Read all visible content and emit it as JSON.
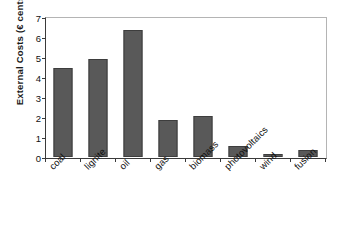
{
  "chart_data": {
    "type": "bar",
    "title": "",
    "xlabel": "",
    "ylabel": "External Costs (€ cents/kWh)",
    "categories": [
      "coal",
      "lignite",
      "oil",
      "gas",
      "biomass",
      "photovoltaics",
      "wind",
      "fusion"
    ],
    "values": [
      4.45,
      4.9,
      6.35,
      1.85,
      2.05,
      0.55,
      0.15,
      0.35
    ],
    "ylim": [
      0,
      7
    ],
    "ytick_labels": [
      "0",
      "1",
      "2",
      "3",
      "4",
      "5",
      "6",
      "7"
    ],
    "ytick_values": [
      0,
      1,
      2,
      3,
      4,
      5,
      6,
      7
    ],
    "grid": false,
    "legend": "none",
    "bar_color": "#595959",
    "bar_edge_color": "#3d3d3d",
    "axis_color": "#3a3a3a",
    "frame_color": "#b4b4b4",
    "background": "#ffffff"
  }
}
